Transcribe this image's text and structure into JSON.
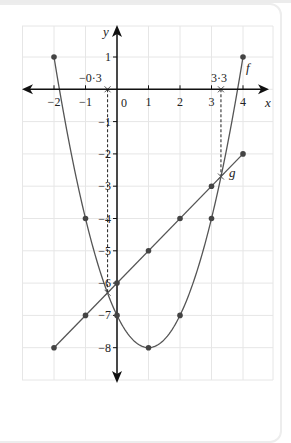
{
  "chart_data": {
    "type": "line",
    "title": "",
    "xlabel": "x",
    "ylabel": "y",
    "xlim": [
      -3,
      5
    ],
    "ylim": [
      -9,
      2
    ],
    "grid": true,
    "x_ticks": [
      -2,
      -1,
      0,
      1,
      2,
      3,
      4
    ],
    "x_tick_labels": [
      "−2",
      "−1",
      "0",
      "1",
      "2",
      "3",
      "4"
    ],
    "y_ticks": [
      1,
      -1,
      -2,
      -3,
      -4,
      -5,
      -6,
      -7,
      -8
    ],
    "y_tick_labels": [
      "1",
      "−1",
      "−2",
      "−3",
      "−4",
      "−5",
      "−6",
      "−7",
      "−8"
    ],
    "series": [
      {
        "name": "f",
        "kind": "curve",
        "equation": "x^2 - 2x - 7",
        "x": [
          -2,
          -1,
          0,
          1,
          2,
          3,
          4
        ],
        "values": [
          1,
          -4,
          -7,
          -8,
          -7,
          -4,
          1
        ]
      },
      {
        "name": "g",
        "kind": "line",
        "equation": "x - 6",
        "x": [
          -2,
          -1,
          0,
          1,
          2,
          3,
          4
        ],
        "values": [
          -8,
          -7,
          -6,
          -5,
          -4,
          -3,
          -2
        ]
      }
    ],
    "annotations": [
      {
        "label": "−0·3",
        "x": -0.3,
        "type": "intersection-dashed-line"
      },
      {
        "label": "3·3",
        "x": 3.3,
        "type": "intersection-dashed-line"
      }
    ],
    "colors": {
      "curve": "#555555",
      "axis": "#111111",
      "grid": "#e6e6e6",
      "point": "#444444"
    }
  },
  "labels": {
    "x_axis": "x",
    "y_axis": "y",
    "f_label": "f",
    "g_label": "g",
    "origin": "0",
    "root_left": "−0·3",
    "root_right": "3·3"
  }
}
